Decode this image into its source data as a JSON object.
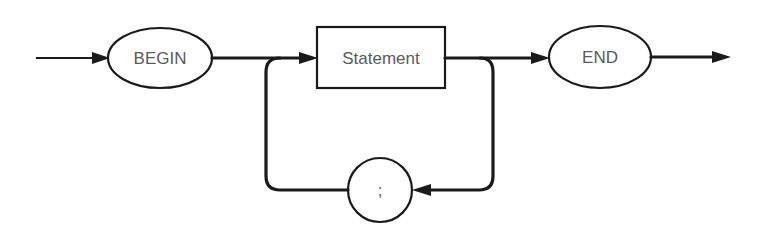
{
  "diagram": {
    "type": "syntax-diagram",
    "nodes": {
      "begin": {
        "label": "BEGIN",
        "shape": "oval"
      },
      "statement": {
        "label": "Statement",
        "shape": "rectangle"
      },
      "separator": {
        "label": ";",
        "shape": "circle"
      },
      "end": {
        "label": "END",
        "shape": "oval"
      }
    },
    "edges": [
      {
        "from": "entry",
        "to": "begin"
      },
      {
        "from": "begin",
        "to": "statement"
      },
      {
        "from": "statement",
        "to": "end"
      },
      {
        "from": "statement",
        "to": "separator",
        "note": "loop back"
      },
      {
        "from": "separator",
        "to": "statement",
        "note": "loop back"
      },
      {
        "from": "end",
        "to": "exit"
      }
    ]
  }
}
